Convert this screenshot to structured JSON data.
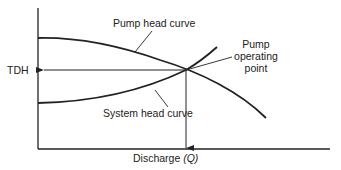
{
  "diagram": {
    "axes": {
      "y_label": "TDH",
      "x_label": "Discharge",
      "x_label_symbol": "(Q)"
    },
    "curves": {
      "pump": {
        "label": "Pump head curve"
      },
      "system": {
        "label": "System head curve"
      }
    },
    "operating_point": {
      "label_line1": "Pump",
      "label_line2": "operating",
      "label_line3": "point"
    },
    "colors": {
      "ink": "#222222",
      "background": "#ffffff"
    }
  }
}
